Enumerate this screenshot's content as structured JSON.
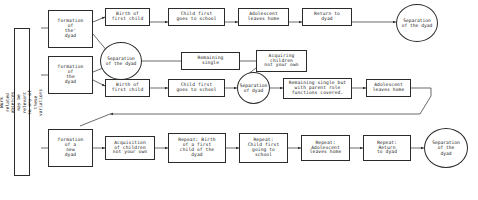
{
  "diagram": {
    "side_label": "Work related absences may be\nrelevant to any of these variations",
    "row1": {
      "origin": "formation\nof\nthe'\ndyad",
      "b1": "Birth of\nfirst child",
      "b2": "Child first\ngoes to school",
      "b3": "Adolescent\nleaves home",
      "b4": "Return to\ndyad",
      "end": "Separation\nof the dyad"
    },
    "row2": {
      "origin": "formation\nof\nthe\ndyad",
      "sep_top": "Separation\nof the dyad",
      "remaining_single": "Remaining\nsingle",
      "acquiring": "Acquiring\nchildren\nnot your own",
      "b1": "Birth of\nfirst child",
      "b2": "Child first\ngoes to school",
      "sep_mid": "Separation\nof dyad",
      "b3": "Remaining single but\nwith parent role\nfunctions covered.",
      "b4": "Adolescent\nleaves home"
    },
    "row3": {
      "origin": "formation\nof a\nnew\ndyad",
      "b1": "Acquisition\nof children\nnot your own",
      "b2": "Repeat: Birth\nof a first\nchild of the\ndyad",
      "b3": "Repeat:\nChild first\ngoing to\nschool",
      "b4": "Repeat:\nAdolescent\nleaves home",
      "b5": "Repeat:\nReturn\nto dyad",
      "end": "Separation\nof the\ndyad"
    },
    "colors": {
      "stroke": "#2b2b2b",
      "background": "#ffffff",
      "text": "#1a1a1a"
    }
  }
}
